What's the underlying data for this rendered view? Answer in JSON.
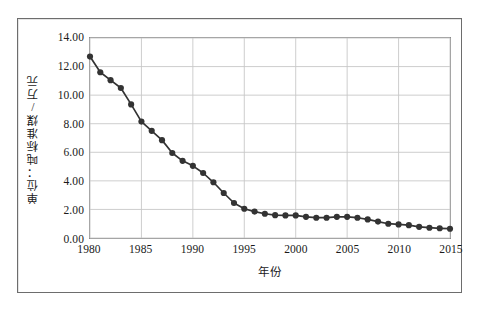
{
  "figure": {
    "caption": ""
  },
  "chart_data": {
    "type": "line",
    "title": "",
    "subtitle": "",
    "xlabel": "年份",
    "ylabel": "单位：吨标准煤/万元",
    "xlim": [
      1980,
      2015
    ],
    "ylim": [
      0.0,
      14.0
    ],
    "grid": true,
    "legend": false,
    "legend_position": "none",
    "marker": "filled-circle",
    "series_color": "#333333",
    "grid_color": "#c8c8c8",
    "axis_color": "#8a8a8a",
    "y_ticks": [
      "0.00",
      "2.00",
      "4.00",
      "6.00",
      "8.00",
      "10.00",
      "12.00",
      "14.00"
    ],
    "y_tick_values": [
      0.0,
      2.0,
      4.0,
      6.0,
      8.0,
      10.0,
      12.0,
      14.0
    ],
    "x_ticks": [
      "1980",
      "1985",
      "1990",
      "1995",
      "2000",
      "2005",
      "2010",
      "2015"
    ],
    "x_tick_values": [
      1980,
      1985,
      1990,
      1995,
      2000,
      2005,
      2010,
      2015
    ],
    "x": [
      1980,
      1981,
      1982,
      1983,
      1984,
      1985,
      1986,
      1987,
      1988,
      1989,
      1990,
      1991,
      1992,
      1993,
      1994,
      1995,
      1996,
      1997,
      1998,
      1999,
      2000,
      2001,
      2002,
      2003,
      2004,
      2005,
      2006,
      2007,
      2008,
      2009,
      2010,
      2011,
      2012,
      2013,
      2014,
      2015
    ],
    "values": [
      12.7,
      11.6,
      11.05,
      10.5,
      9.35,
      8.15,
      7.5,
      6.85,
      5.95,
      5.4,
      5.05,
      4.55,
      3.9,
      3.15,
      2.45,
      2.05,
      1.85,
      1.7,
      1.6,
      1.58,
      1.58,
      1.48,
      1.42,
      1.42,
      1.48,
      1.48,
      1.42,
      1.3,
      1.15,
      1.0,
      0.95,
      0.9,
      0.78,
      0.72,
      0.68,
      0.65
    ]
  }
}
